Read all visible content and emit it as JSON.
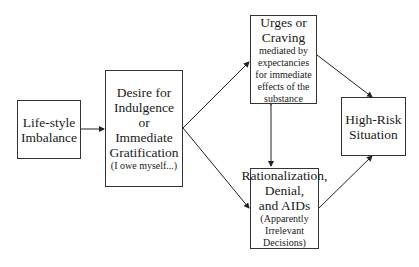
{
  "diagram": {
    "nodes": {
      "lifestyle": {
        "lines": [
          "Life-style",
          "Imbalance"
        ]
      },
      "desire": {
        "lines": [
          "Desire for",
          "Indulgence",
          "or",
          "Immediate",
          "Gratification"
        ],
        "note": "(I owe myself...)"
      },
      "urges": {
        "lines": [
          "Urges or",
          "Craving"
        ],
        "note_lines": [
          "mediated by",
          "expectancies",
          "for immediate",
          "effects of the",
          "substance"
        ]
      },
      "rationalization": {
        "lines": [
          "Rationalization,",
          "Denial,",
          "and AIDs"
        ],
        "note_lines": [
          "(Apparently",
          "Irrelevant",
          "Decisions)"
        ]
      },
      "highrisk": {
        "lines": [
          "High-Risk",
          "Situation"
        ]
      }
    },
    "edges": [
      {
        "from": "lifestyle",
        "to": "desire"
      },
      {
        "from": "desire",
        "to": "urges"
      },
      {
        "from": "desire",
        "to": "rationalization"
      },
      {
        "from": "urges",
        "to": "rationalization",
        "bidirectional": true
      },
      {
        "from": "urges",
        "to": "highrisk"
      },
      {
        "from": "rationalization",
        "to": "highrisk"
      }
    ]
  }
}
